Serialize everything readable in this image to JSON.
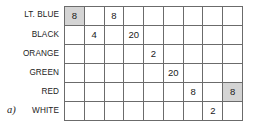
{
  "figure": {
    "tag": "a)",
    "shaded_color": "#d4d4d4",
    "grid_line_color": "#6b6b6b",
    "background_color": "#ffffff"
  },
  "chart_data": {
    "type": "table",
    "title": "",
    "xlabel": "",
    "ylabel": "",
    "rows": 6,
    "columns": 9,
    "grid": true,
    "row_labels": [
      "LT. BLUE",
      "BLACK",
      "ORANGE",
      "GREEN",
      "RED",
      "WHITE"
    ],
    "column_labels": [
      "",
      "",
      "",
      "",
      "",
      "",
      "",
      "",
      ""
    ],
    "cells": [
      [
        {
          "value": "8",
          "shaded": true
        },
        {
          "value": "",
          "shaded": false
        },
        {
          "value": "8",
          "shaded": false
        },
        {
          "value": "",
          "shaded": false
        },
        {
          "value": "",
          "shaded": false
        },
        {
          "value": "",
          "shaded": false
        },
        {
          "value": "",
          "shaded": false
        },
        {
          "value": "",
          "shaded": false
        },
        {
          "value": "",
          "shaded": false
        }
      ],
      [
        {
          "value": "",
          "shaded": false
        },
        {
          "value": "4",
          "shaded": false
        },
        {
          "value": "",
          "shaded": false
        },
        {
          "value": "20",
          "shaded": false
        },
        {
          "value": "",
          "shaded": false
        },
        {
          "value": "",
          "shaded": false
        },
        {
          "value": "",
          "shaded": false
        },
        {
          "value": "",
          "shaded": false
        },
        {
          "value": "",
          "shaded": false
        }
      ],
      [
        {
          "value": "",
          "shaded": false
        },
        {
          "value": "",
          "shaded": false
        },
        {
          "value": "",
          "shaded": false
        },
        {
          "value": "",
          "shaded": false
        },
        {
          "value": "2",
          "shaded": false
        },
        {
          "value": "",
          "shaded": false
        },
        {
          "value": "",
          "shaded": false
        },
        {
          "value": "",
          "shaded": false
        },
        {
          "value": "",
          "shaded": false
        }
      ],
      [
        {
          "value": "",
          "shaded": false
        },
        {
          "value": "",
          "shaded": false
        },
        {
          "value": "",
          "shaded": false
        },
        {
          "value": "",
          "shaded": false
        },
        {
          "value": "",
          "shaded": false
        },
        {
          "value": "20",
          "shaded": false
        },
        {
          "value": "",
          "shaded": false
        },
        {
          "value": "",
          "shaded": false
        },
        {
          "value": "",
          "shaded": false
        }
      ],
      [
        {
          "value": "",
          "shaded": false
        },
        {
          "value": "",
          "shaded": false
        },
        {
          "value": "",
          "shaded": false
        },
        {
          "value": "",
          "shaded": false
        },
        {
          "value": "",
          "shaded": false
        },
        {
          "value": "",
          "shaded": false
        },
        {
          "value": "8",
          "shaded": false
        },
        {
          "value": "",
          "shaded": false
        },
        {
          "value": "8",
          "shaded": true
        }
      ],
      [
        {
          "value": "",
          "shaded": false
        },
        {
          "value": "",
          "shaded": false
        },
        {
          "value": "",
          "shaded": false
        },
        {
          "value": "",
          "shaded": false
        },
        {
          "value": "",
          "shaded": false
        },
        {
          "value": "",
          "shaded": false
        },
        {
          "value": "",
          "shaded": false
        },
        {
          "value": "2",
          "shaded": false
        },
        {
          "value": "",
          "shaded": false
        }
      ]
    ]
  }
}
